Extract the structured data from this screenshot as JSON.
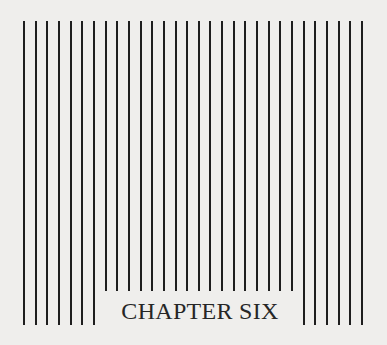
{
  "page": {
    "heading": "CHAPTER SIX",
    "decoration": {
      "type": "vertical-rules",
      "count": 30,
      "color": "#1e1e1e",
      "background": "#efeeec"
    }
  }
}
